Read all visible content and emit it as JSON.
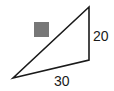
{
  "diagram": {
    "type": "geometry-figure",
    "shape": "triangle",
    "background": "#ffffff",
    "stroke_color": "#1a1a1a",
    "triangle": {
      "vertices": [
        {
          "name": "bottom-left",
          "x": 13,
          "y": 78
        },
        {
          "name": "bottom-right",
          "x": 89,
          "y": 60
        },
        {
          "name": "top",
          "x": 89,
          "y": 7
        }
      ]
    },
    "square_marker": {
      "x": 34,
      "y": 22,
      "size": 15,
      "fill": "#777777"
    },
    "labels": {
      "vertical_side": "20",
      "bottom_side": "30"
    }
  }
}
